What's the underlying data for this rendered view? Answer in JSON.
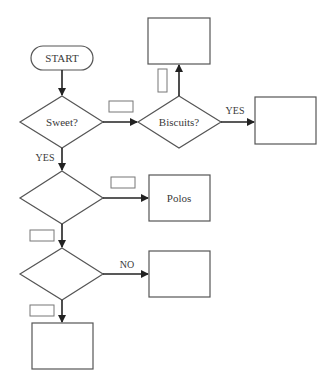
{
  "diagram": {
    "type": "flowchart",
    "nodes": {
      "start": {
        "label": "START",
        "shape": "terminator"
      },
      "sweet": {
        "label": "Sweet?",
        "shape": "decision"
      },
      "biscuits": {
        "label": "Biscuits?",
        "shape": "decision"
      },
      "biscuits_top_box": {
        "label": "",
        "shape": "process"
      },
      "biscuits_yes_box": {
        "label": "",
        "shape": "process"
      },
      "decision_2": {
        "label": "",
        "shape": "decision"
      },
      "polos": {
        "label": "Polos",
        "shape": "process"
      },
      "decision_3": {
        "label": "",
        "shape": "decision"
      },
      "decision_3_no_box": {
        "label": "",
        "shape": "process"
      },
      "bottom_box": {
        "label": "",
        "shape": "process"
      }
    },
    "edges": {
      "sweet_to_biscuits": {
        "label": "",
        "blank": true
      },
      "biscuits_to_top": {
        "label": "",
        "blank": true
      },
      "biscuits_yes": {
        "label": "YES"
      },
      "sweet_yes": {
        "label": "YES"
      },
      "d2_to_polos": {
        "label": "",
        "blank": true
      },
      "d2_to_d3": {
        "label": "",
        "blank": true
      },
      "d3_no": {
        "label": "NO"
      },
      "d3_to_bottom": {
        "label": "",
        "blank": true
      }
    },
    "colors": {
      "stroke": "#555555",
      "arrow": "#222222",
      "text": "#3a3a3a",
      "background": "#ffffff"
    }
  }
}
